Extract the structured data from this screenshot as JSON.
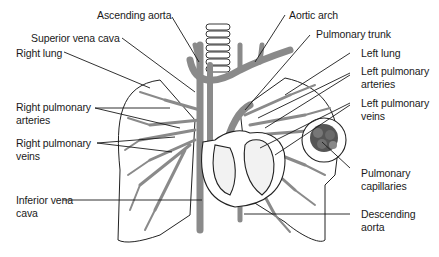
{
  "diagram": {
    "colors": {
      "vessel": "#8a8a8a",
      "outline": "#222222",
      "background": "#ffffff",
      "leader": "#1a1a1a"
    },
    "labels": {
      "ascending_aorta": "Ascending aorta",
      "aortic_arch": "Aortic arch",
      "superior_vena_cava": "Superior vena cava",
      "pulmonary_trunk": "Pulmonary trunk",
      "right_lung": "Right lung",
      "left_lung": "Left lung",
      "left_pulmonary_arteries_1": "Left pulmonary",
      "left_pulmonary_arteries_2": "arteries",
      "right_pulmonary_arteries_1": "Right pulmonary",
      "right_pulmonary_arteries_2": "arteries",
      "left_pulmonary_veins_1": "Left pulmonary",
      "left_pulmonary_veins_2": "veins",
      "right_pulmonary_veins_1": "Right pulmonary",
      "right_pulmonary_veins_2": "veins",
      "pulmonary_capillaries_1": "Pulmonary",
      "pulmonary_capillaries_2": "capillaries",
      "inferior_vena_cava_1": "Inferior vena",
      "inferior_vena_cava_2": "cava",
      "descending_aorta_1": "Descending",
      "descending_aorta_2": "aorta"
    }
  }
}
